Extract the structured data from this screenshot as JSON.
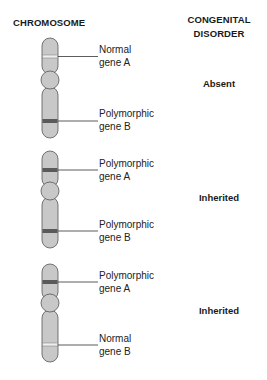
{
  "headers": {
    "chromosome": "CHROMOSOME",
    "disorder_line1": "CONGENITAL",
    "disorder_line2": "DISORDER"
  },
  "colors": {
    "chromosome_fill": "#c8c8c8",
    "outline": "#555555",
    "polymorphic_band": "#5a5a5a",
    "normal_band": "#eeeeee",
    "leader_line": "#333333"
  },
  "rows": [
    {
      "gene_a": {
        "line1": "Normal",
        "line2": "gene A",
        "type": "normal"
      },
      "gene_b": {
        "line1": "Polymorphic",
        "line2": "gene B",
        "type": "polymorphic"
      },
      "disorder": "Absent"
    },
    {
      "gene_a": {
        "line1": "Polymorphic",
        "line2": "gene A",
        "type": "polymorphic"
      },
      "gene_b": {
        "line1": "Polymorphic",
        "line2": "gene B",
        "type": "polymorphic"
      },
      "disorder": "Inherited"
    },
    {
      "gene_a": {
        "line1": "Polymorphic",
        "line2": "gene A",
        "type": "polymorphic"
      },
      "gene_b": {
        "line1": "Normal",
        "line2": "gene B",
        "type": "normal"
      },
      "disorder": "Inherited"
    }
  ]
}
